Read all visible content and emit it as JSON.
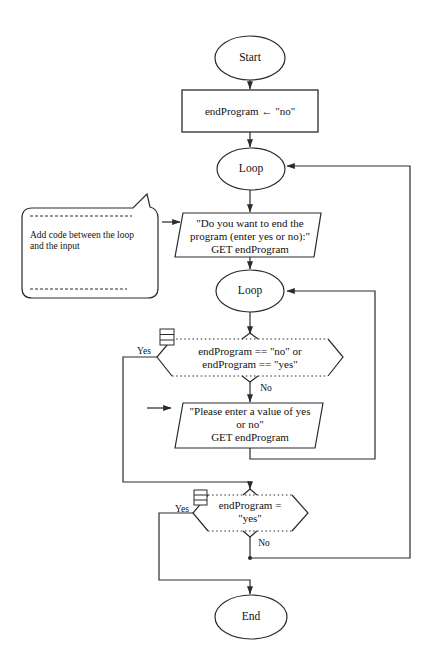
{
  "colors": {
    "line": "#2b2b2b",
    "text": "#111111",
    "background": "#ffffff"
  },
  "diagram": {
    "start_label": "Start",
    "init_label": "endProgram ← \"no\"",
    "loop1_label": "Loop",
    "loop2_label": "Loop",
    "end_label": "End",
    "input1": {
      "line1": "\"Do you want to end the",
      "line2": "program (enter yes or no):\"",
      "line3": "GET endProgram"
    },
    "input2": {
      "line1": "\"Please enter a value of yes",
      "line2": "or no\"",
      "line3": "GET endProgram"
    },
    "decision1": {
      "line1": "endProgram == \"no\" or",
      "line2": "endProgram == \"yes\"",
      "yes": "Yes",
      "no": "No"
    },
    "decision2": {
      "line1": "endProgram =",
      "line2": "\"yes\"",
      "yes": "Yes",
      "no": "No"
    },
    "callout": {
      "line1": "Add code between the loop",
      "line2": "and the input"
    }
  }
}
